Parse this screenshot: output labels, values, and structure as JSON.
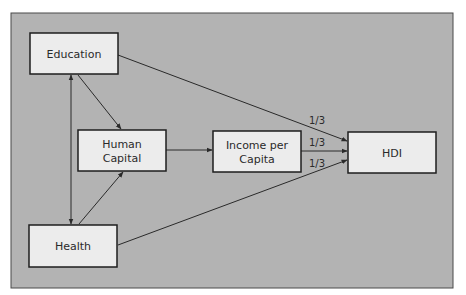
{
  "diagram": {
    "type": "flow",
    "colors": {
      "panel_fill": "#b3b3b3",
      "panel_border": "#4a4a4a",
      "box_fill": "#ececec",
      "box_border": "#1e1e1e",
      "edge": "#2a2a2a"
    },
    "nodes": [
      {
        "id": "education",
        "label_lines": [
          "Education"
        ]
      },
      {
        "id": "human-capital",
        "label_lines": [
          "Human",
          "Capital"
        ]
      },
      {
        "id": "income-per-capita",
        "label_lines": [
          "Income per",
          "Capita"
        ]
      },
      {
        "id": "hdi",
        "label_lines": [
          "HDI"
        ]
      },
      {
        "id": "health",
        "label_lines": [
          "Health"
        ]
      }
    ],
    "edges": [
      {
        "from": "education",
        "to": "health",
        "bidirectional": true,
        "label": ""
      },
      {
        "from": "education",
        "to": "human-capital",
        "bidirectional": false,
        "label": ""
      },
      {
        "from": "health",
        "to": "human-capital",
        "bidirectional": false,
        "label": ""
      },
      {
        "from": "human-capital",
        "to": "income-per-capita",
        "bidirectional": false,
        "label": ""
      },
      {
        "from": "education",
        "to": "hdi",
        "bidirectional": false,
        "label": "1/3"
      },
      {
        "from": "income-per-capita",
        "to": "hdi",
        "bidirectional": false,
        "label": "1/3"
      },
      {
        "from": "health",
        "to": "hdi",
        "bidirectional": false,
        "label": "1/3"
      }
    ]
  }
}
